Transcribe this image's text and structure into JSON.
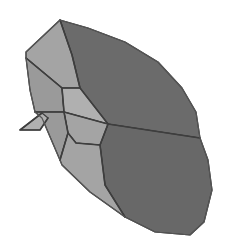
{
  "figure": {
    "type": "polyhedron-rendering",
    "colors": {
      "background": "#ffffff",
      "dark_face": "#6b6b6b",
      "dark_face_lower": "#686868",
      "light_face": "#a4a4a4",
      "light_face_alt": "#9a9a9a",
      "light_face_pale": "#b0b0b0",
      "edge": "#3e3e3e"
    },
    "faces": [
      {
        "name": "upper-dark-face",
        "shade": "dark_face",
        "points": "60,20 88,28 125,42 158,62 182,88 196,112 200,138 108,124 80,88 72,55"
      },
      {
        "name": "lower-dark-face",
        "shade": "dark_face_lower",
        "points": "108,124 200,138 208,160 212,190 204,222 190,235 155,232 125,217 105,185 100,145"
      },
      {
        "name": "top-left-light-face",
        "shade": "light_face",
        "points": "60,20 72,55 80,88 62,88 26,58 26,52"
      },
      {
        "name": "left-light-face",
        "shade": "light_face_alt",
        "points": "26,58 62,88 64,112 35,112 30,90"
      },
      {
        "name": "center-light-face",
        "shade": "light_face_pale",
        "points": "62,88 80,88 108,124 64,112"
      },
      {
        "name": "mid-light-face",
        "shade": "light_face",
        "points": "64,112 108,124 100,145 76,143 68,133"
      },
      {
        "name": "lower-left-light-face",
        "shade": "light_face_alt",
        "points": "35,112 64,112 68,133 60,160 42,118"
      },
      {
        "name": "bottom-light-face",
        "shade": "light_face",
        "points": "68,133 76,143 100,145 105,185 125,217 90,192 62,165 60,160"
      },
      {
        "name": "spike-face",
        "shade": "light_face_pale",
        "points": "42,113 48,118 40,130 20,130"
      }
    ]
  }
}
